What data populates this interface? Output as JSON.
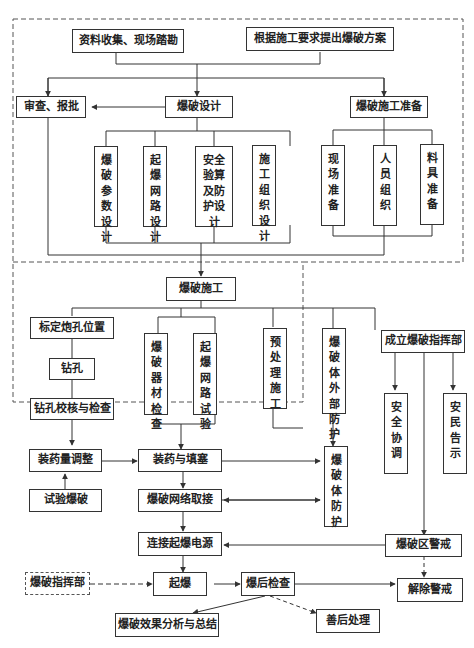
{
  "diagram": {
    "type": "flowchart",
    "planning_group": {
      "top": {
        "survey": "资料收集、现场踏勘",
        "propose_plan": "根据施工要求提出爆破方案"
      },
      "review_approve": "审查、报批",
      "blast_design": "爆破设计",
      "blast_prep": "爆破施工准备",
      "design_items": [
        "爆破参数设计",
        "起爆网路设计",
        "安全验算及防护设计",
        "施工组织设计"
      ],
      "prep_items": [
        "现场准备",
        "人员组织",
        "料具准备"
      ]
    },
    "construction_group": {
      "blast_construction": "爆破施工",
      "mark_holes": "标定炮孔位置",
      "drilling": "钻孔",
      "drill_check": "钻孔校核与检查",
      "checks": [
        "爆破器材检查",
        "起爆网路试验"
      ],
      "pretreatment": "预处理施工"
    },
    "external_protection": "爆破体外部防护",
    "command": {
      "establish": "成立爆破指挥部",
      "safety_coord": "安全协调",
      "public_notice": "安民告示"
    },
    "execution": {
      "charge_adjust": "装药量调整",
      "test_blast": "试验爆破",
      "charge_stem": "装药与填塞",
      "body_protection": "爆破体防护",
      "network_connect": "爆破网络取接",
      "connect_power": "连接起爆电源",
      "zone_alert": "爆破区警戒",
      "command_post": "爆破指挥部",
      "detonate": "起爆",
      "post_check": "爆后检查",
      "lift_alert": "解除警戒",
      "analysis": "爆破效果分析与总结",
      "aftermath": "善后处理"
    }
  }
}
